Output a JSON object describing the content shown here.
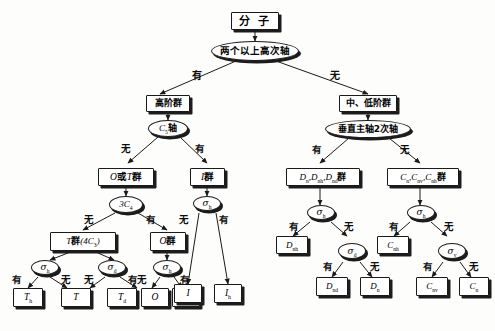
{
  "diagram": {
    "ink": "#1a1a1a",
    "paper": "#fdfdfc"
  },
  "nodes": {
    "molecule": {
      "label": "分  子",
      "kind": "box",
      "script": "han"
    },
    "two_high_axes": {
      "label": "两个以上高次轴",
      "kind": "oval",
      "script": "han"
    },
    "high_order": {
      "label": "高阶群",
      "kind": "box",
      "script": "han"
    },
    "mid_low_order": {
      "label": "中、低阶群",
      "kind": "box",
      "script": "han"
    },
    "c5_axis": {
      "label": "C5轴",
      "kind": "oval",
      "script": "mix"
    },
    "perp_c2": {
      "label": "垂直主轴2次轴",
      "kind": "oval",
      "script": "han"
    },
    "o_or_t_group": {
      "label": "O或T群",
      "kind": "box",
      "script": "mix"
    },
    "i_group": {
      "label": "I群",
      "kind": "box",
      "script": "mix"
    },
    "d_groups": {
      "label": "Dn,Dnh,Nnd群",
      "kind": "box",
      "script": "mix"
    },
    "c_groups": {
      "label": "Cn,Cnv,Cnh群",
      "kind": "box",
      "script": "mix"
    },
    "three_c4": {
      "label": "3C4",
      "kind": "oval",
      "script": "sym"
    },
    "sigma_h_i": {
      "label": "σh",
      "kind": "oval",
      "script": "sym"
    },
    "sigma_h_d": {
      "label": "σh",
      "kind": "oval",
      "script": "sym"
    },
    "sigma_h_c": {
      "label": "σh",
      "kind": "oval",
      "script": "sym"
    },
    "t_group_4c3": {
      "label": "T群(4C3)",
      "kind": "box",
      "script": "mix"
    },
    "o_group": {
      "label": "O群",
      "kind": "box",
      "script": "mix"
    },
    "sigma_h_t": {
      "label": "σh",
      "kind": "oval",
      "script": "sym"
    },
    "sigma_d_t": {
      "label": "σd",
      "kind": "oval",
      "script": "sym"
    },
    "sigma_h_o": {
      "label": "σh",
      "kind": "oval",
      "script": "sym"
    },
    "sigma_d_dn": {
      "label": "σd",
      "kind": "oval",
      "script": "sym"
    },
    "sigma_v_cn": {
      "label": "σv",
      "kind": "oval",
      "script": "sym"
    },
    "leaf_i": {
      "label": "I",
      "kind": "box",
      "script": "sym"
    },
    "leaf_ih": {
      "label": "Ih",
      "kind": "box",
      "script": "sym"
    },
    "leaf_th": {
      "label": "Th",
      "kind": "box",
      "script": "sym"
    },
    "leaf_t": {
      "label": "T",
      "kind": "box",
      "script": "sym"
    },
    "leaf_td": {
      "label": "Td",
      "kind": "box",
      "script": "sym"
    },
    "leaf_o": {
      "label": "O",
      "kind": "box",
      "script": "sym"
    },
    "leaf_oh": {
      "label": "Oh",
      "kind": "box",
      "script": "sym"
    },
    "leaf_dnh": {
      "label": "Dnh",
      "kind": "box",
      "script": "sym"
    },
    "leaf_dnd": {
      "label": "Dnd",
      "kind": "box",
      "script": "sym"
    },
    "leaf_dn": {
      "label": "Dn",
      "kind": "box",
      "script": "sym"
    },
    "leaf_cnh": {
      "label": "Cnh",
      "kind": "box",
      "script": "sym"
    },
    "leaf_cnv": {
      "label": "Cnv",
      "kind": "box",
      "script": "sym"
    },
    "leaf_cn": {
      "label": "Cn",
      "kind": "box",
      "script": "sym"
    }
  },
  "edge_labels": {
    "yes": "有",
    "no": "无",
    "two_high_axes_yes": "有",
    "two_high_axes_no": "无",
    "c5_no": "无",
    "c5_yes": "有",
    "perp_yes": "有",
    "perp_no": "无",
    "threec4_no": "无",
    "threec4_yes": "有",
    "sigmah_i_no": "无",
    "sigmah_i_yes": "有",
    "sigmah_t_yes": "有",
    "sigmah_t_no": "无",
    "sigmad_t_no": "无",
    "sigmad_t_yes": "有",
    "sigmah_o_no": "无",
    "sigmah_o_yes": "有",
    "sigmah_d_yes": "有",
    "sigmah_d_no": "无",
    "sigmad_dn_yes": "有",
    "sigmad_dn_no": "无",
    "sigmah_c_yes": "有",
    "sigmah_c_no": "无",
    "sigmav_cn_yes": "有",
    "sigmav_cn_no": "无"
  }
}
